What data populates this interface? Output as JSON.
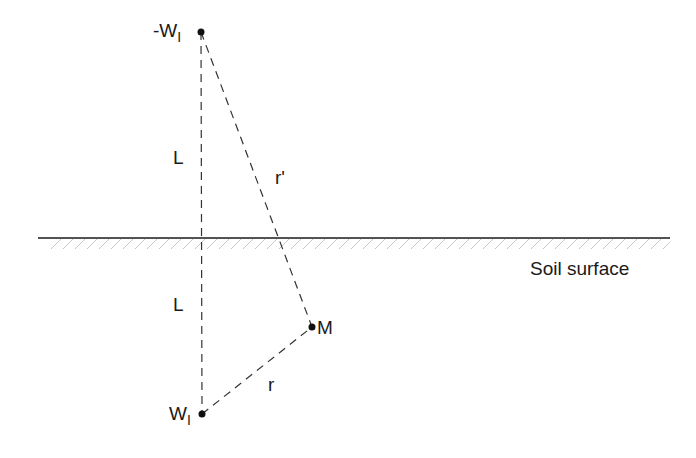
{
  "diagram": {
    "labels": {
      "image_well": "-W",
      "image_well_sub": "I",
      "real_well": "W",
      "real_well_sub": "I",
      "point": "M",
      "upper_distance": "L",
      "lower_distance": "L",
      "distance_image": "r'",
      "distance_real": "r",
      "surface": "Soil surface"
    },
    "points": {
      "image_well": {
        "x": 201,
        "y": 32
      },
      "real_well": {
        "x": 202,
        "y": 414
      },
      "M": {
        "x": 312,
        "y": 327
      }
    },
    "surface_line": {
      "x1": 38,
      "x2": 670,
      "y": 238
    },
    "colors": {
      "line": "#1a1a1a",
      "hatch": "#bbbbbb"
    }
  }
}
